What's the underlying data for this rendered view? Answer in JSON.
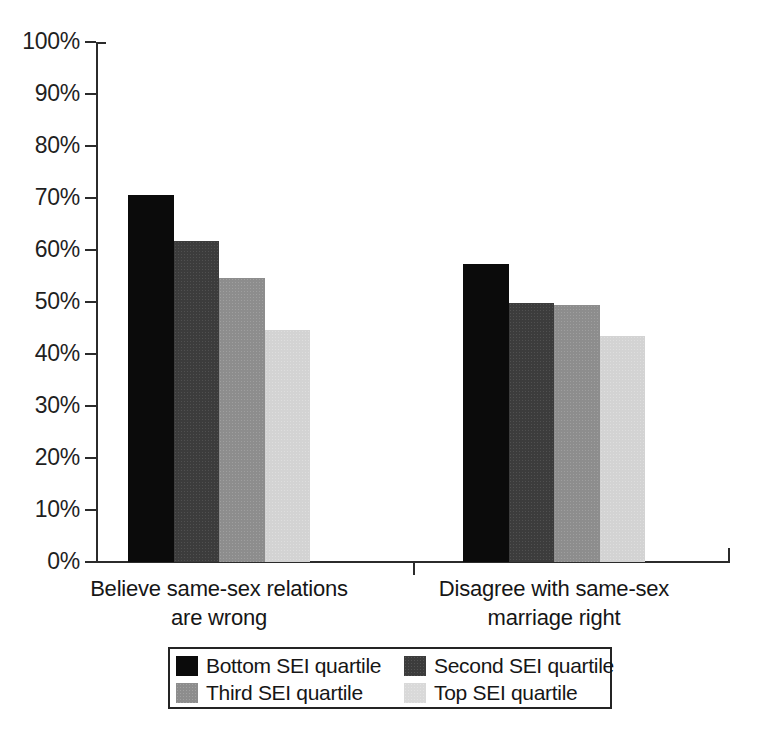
{
  "chart_data": {
    "type": "bar",
    "title": "",
    "subtitle": "",
    "xlabel": "",
    "ylabel": "",
    "categories": [
      "Believe same-sex relations are wrong",
      "Disagree with same-sex marriage right"
    ],
    "category_lines": [
      [
        "Believe same-sex relations",
        "are wrong"
      ],
      [
        "Disagree with same-sex",
        "marriage right"
      ]
    ],
    "series": [
      {
        "name": "Bottom SEI quartile",
        "values": [
          70.6,
          57.3
        ],
        "color": "#0b0b0b"
      },
      {
        "name": "Second SEI quartile",
        "values": [
          61.7,
          49.8
        ],
        "color": "#3c3c3c"
      },
      {
        "name": "Third SEI quartile",
        "values": [
          54.6,
          49.4
        ],
        "color": "#8d8d8d"
      },
      {
        "name": "Top SEI quartile",
        "values": [
          44.6,
          43.5
        ],
        "color": "#d3d3d3"
      }
    ],
    "ylim": [
      0,
      100
    ],
    "ytick_values": [
      0,
      10,
      20,
      30,
      40,
      50,
      60,
      70,
      80,
      90,
      100
    ],
    "ytick_labels": [
      "0%",
      "10%",
      "20%",
      "30%",
      "40%",
      "50%",
      "60%",
      "70%",
      "80%",
      "90%",
      "100%"
    ],
    "grid": false,
    "legend_position": "bottom",
    "value_format": "percent"
  },
  "legend": {
    "items": [
      {
        "label": "Bottom SEI quartile"
      },
      {
        "label": "Second SEI quartile"
      },
      {
        "label": "Third SEI quartile"
      },
      {
        "label": "Top SEI quartile"
      }
    ]
  }
}
